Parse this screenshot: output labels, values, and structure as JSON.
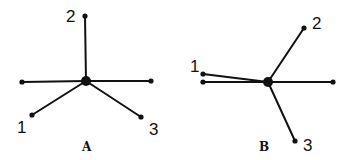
{
  "colors": {
    "ink": "#111111",
    "background": "#ffffff"
  },
  "diagrams": [
    {
      "caption": "A",
      "center": {
        "x": 86,
        "y": 81,
        "r": 5
      },
      "endpoints": [
        {
          "id": "2",
          "x": 85,
          "y": 16,
          "label": "2",
          "lx": 66,
          "ly": 22
        },
        {
          "id": "left",
          "x": 22,
          "y": 82,
          "label": "",
          "lx": 0,
          "ly": 0
        },
        {
          "id": "right",
          "x": 151,
          "y": 81,
          "label": "",
          "lx": 0,
          "ly": 0
        },
        {
          "id": "1",
          "x": 32,
          "y": 115,
          "label": "1",
          "lx": 17,
          "ly": 133
        },
        {
          "id": "3",
          "x": 141,
          "y": 117,
          "label": "3",
          "lx": 149,
          "ly": 135
        }
      ],
      "caption_pos": {
        "x": 82,
        "y": 151
      }
    },
    {
      "caption": "B",
      "center": {
        "x": 268,
        "y": 82,
        "r": 5
      },
      "endpoints": [
        {
          "id": "2",
          "x": 304,
          "y": 28,
          "label": "2",
          "lx": 312,
          "ly": 29
        },
        {
          "id": "1",
          "x": 203,
          "y": 74,
          "label": "1",
          "lx": 190,
          "ly": 72
        },
        {
          "id": "left",
          "x": 203,
          "y": 82,
          "label": "",
          "lx": 0,
          "ly": 0
        },
        {
          "id": "right",
          "x": 333,
          "y": 82,
          "label": "",
          "lx": 0,
          "ly": 0
        },
        {
          "id": "3",
          "x": 295,
          "y": 141,
          "label": "3",
          "lx": 303,
          "ly": 151
        }
      ],
      "caption_pos": {
        "x": 259,
        "y": 151
      }
    }
  ]
}
